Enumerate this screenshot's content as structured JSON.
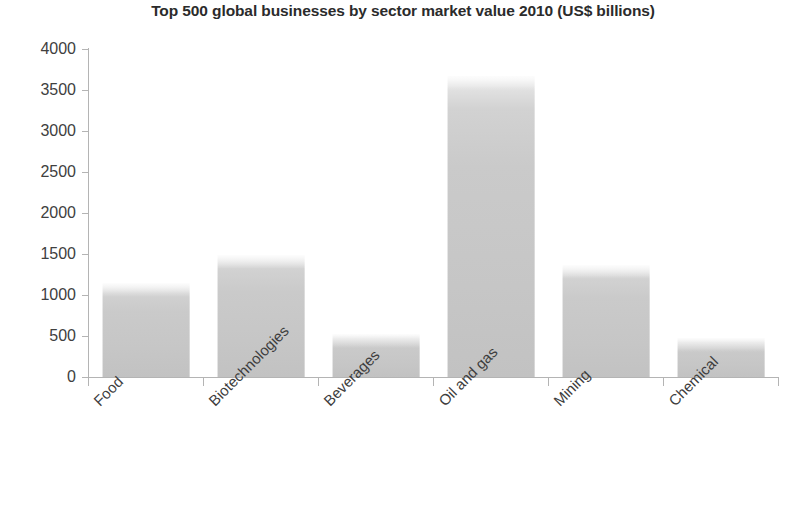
{
  "chart_data": {
    "type": "bar",
    "title": "Top 500 global businesses by sector market value 2010 (US$ billions)",
    "xlabel": "",
    "ylabel": "",
    "categories": [
      "Food",
      "Biotechnologies",
      "Beverages",
      "Oil and gas",
      "Mining",
      "Chemical"
    ],
    "values": [
      1150,
      1490,
      530,
      3670,
      1360,
      480
    ],
    "ylim": [
      0,
      4000
    ],
    "yticks": [
      0,
      500,
      1000,
      1500,
      2000,
      2500,
      3000,
      3500,
      4000
    ],
    "ytick_labels": [
      "0",
      "500",
      "1000",
      "1500",
      "2000",
      "2500",
      "3000",
      "3500",
      "4000"
    ],
    "grid": false,
    "legend": "none",
    "series": [
      {
        "name": "Market value (US$ billions)",
        "values": [
          1150,
          1490,
          530,
          3670,
          1360,
          480
        ],
        "color": "#c8c8c8"
      }
    ]
  },
  "colors": {
    "bar_fill": "#c8c8c8",
    "bar_highlight": "#efefef",
    "axis": "#b4b4b4",
    "title_text": "#2b2b2b",
    "label_text": "#3d3d3d",
    "background": "#ffffff"
  }
}
